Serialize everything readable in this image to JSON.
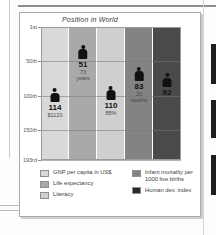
{
  "figure": {
    "title": "Position in World"
  },
  "chart_data": {
    "type": "bar",
    "title": "Position in World",
    "xlabel": "",
    "ylabel": "Position in World",
    "ylim": [
      1,
      193
    ],
    "y_tick_labels": [
      "1st",
      "50th",
      "100th",
      "150th",
      "193rd"
    ],
    "y_tick_values": [
      1,
      50,
      100,
      150,
      193
    ],
    "grid": true,
    "legend_position": "bottom",
    "categories": [
      "GNP per capita in US$",
      "Life expectancy",
      "Literacy",
      "Infant mortality per 1000 live births",
      "Human dev. index"
    ],
    "values": [
      114,
      51,
      110,
      83,
      92
    ],
    "point_labels": [
      "114",
      "51",
      "110",
      "83",
      "92"
    ],
    "value_labels": [
      "$1120",
      "73 years",
      "85%",
      "20 deaths",
      ""
    ],
    "bar_colors": [
      "#d9d9d9",
      "#a9a9a9",
      "#cfcfcf",
      "#838383",
      "#4a4a4a"
    ]
  },
  "markers": [
    {
      "rank": "114",
      "value_line1": "$1120",
      "value_line2": ""
    },
    {
      "rank": "51",
      "value_line1": "73",
      "value_line2": "years"
    },
    {
      "rank": "110",
      "value_line1": "85%",
      "value_line2": ""
    },
    {
      "rank": "83",
      "value_line1": "20",
      "value_line2": "deaths"
    },
    {
      "rank": "92",
      "value_line1": "",
      "value_line2": ""
    }
  ],
  "axis": {
    "ticks": [
      "1st",
      "50th",
      "100th",
      "150th",
      "193rd"
    ]
  },
  "legend": {
    "left": [
      {
        "label": "GNP per capita in US$",
        "color": "#d9d9d9"
      },
      {
        "label": "Life expectancy",
        "color": "#a9a9a9"
      },
      {
        "label": "Literacy",
        "color": "#cfcfcf"
      }
    ],
    "right": [
      {
        "label_line1": "Infant mortality per",
        "label_line2": "1000 live births",
        "color": "#838383"
      },
      {
        "label_line1": "Human dev. index",
        "label_line2": "",
        "color": "#2a2a2a"
      }
    ]
  }
}
